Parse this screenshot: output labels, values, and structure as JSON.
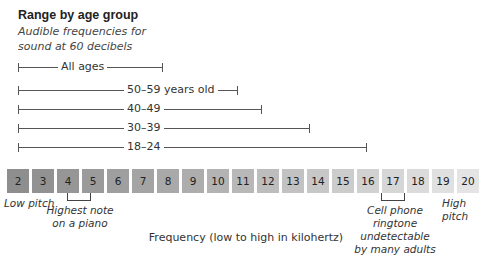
{
  "header": {
    "title": "Range by age group",
    "subtitle": "Audible frequencies for sound at 60 decibels"
  },
  "chart_data": {
    "type": "range",
    "title": "Range by age group",
    "subtitle": "Audible frequencies for sound at 60 decibels",
    "xlabel": "Frequency (low to high in kilohertz)",
    "categories": [
      "2",
      "3",
      "4",
      "5",
      "6",
      "7",
      "8",
      "9",
      "10",
      "11",
      "12",
      "13",
      "14",
      "15",
      "16",
      "17",
      "18",
      "19",
      "20"
    ],
    "series": [
      {
        "name": "All ages",
        "start": 2,
        "end": 8
      },
      {
        "name": "50–59 years old",
        "start": 2,
        "end": 11
      },
      {
        "name": "40–49",
        "start": 2,
        "end": 12
      },
      {
        "name": "30–39",
        "start": 2,
        "end": 14
      },
      {
        "name": "18–24",
        "start": 2,
        "end": 16
      }
    ],
    "annotations": [
      {
        "at": 2,
        "text": "Low pitch"
      },
      {
        "at": 4,
        "text": "Highest note on a piano"
      },
      {
        "at": 17,
        "text": "Cell phone ringtone undetectable by many adults"
      },
      {
        "at": 20,
        "text": "High pitch"
      }
    ]
  },
  "ranges": [
    {
      "label": "All ages",
      "end_x": 163,
      "label_x": 58
    },
    {
      "label": "50–59 years old",
      "end_x": 238,
      "label_x": 124
    },
    {
      "label": "40–49",
      "end_x": 262,
      "label_x": 124
    },
    {
      "label": "30–39",
      "end_x": 310,
      "label_x": 124
    },
    {
      "label": "18–24",
      "end_x": 367,
      "label_x": 124
    }
  ],
  "boxes": [
    {
      "label": "2",
      "color": "#8e8e8e"
    },
    {
      "label": "3",
      "color": "#929292"
    },
    {
      "label": "4",
      "color": "#969696"
    },
    {
      "label": "5",
      "color": "#9b9b9b"
    },
    {
      "label": "6",
      "color": "#9f9f9f"
    },
    {
      "label": "7",
      "color": "#a4a4a4"
    },
    {
      "label": "8",
      "color": "#a9a9a9"
    },
    {
      "label": "9",
      "color": "#adadad"
    },
    {
      "label": "10",
      "color": "#b3b3b3"
    },
    {
      "label": "11",
      "color": "#b8b8b8"
    },
    {
      "label": "12",
      "color": "#bdbdbd"
    },
    {
      "label": "13",
      "color": "#c2c2c2"
    },
    {
      "label": "14",
      "color": "#c7c7c7"
    },
    {
      "label": "15",
      "color": "#cccccc"
    },
    {
      "label": "16",
      "color": "#d1d1d1"
    },
    {
      "label": "17",
      "color": "#d6d6d6"
    },
    {
      "label": "18",
      "color": "#dbdbdb"
    },
    {
      "label": "19",
      "color": "#e0e0e0"
    },
    {
      "label": "20",
      "color": "#e4e4e4"
    }
  ],
  "notes": {
    "low_pitch": "Low pitch",
    "piano_line1": "Highest note",
    "piano_line2": "on a piano",
    "phone_line1": "Cell phone",
    "phone_line2": "ringtone undetectable",
    "phone_line3": "by many adults",
    "high_pitch": "High pitch"
  },
  "axis": {
    "label": "Frequency (low to high in kilohertz)"
  }
}
